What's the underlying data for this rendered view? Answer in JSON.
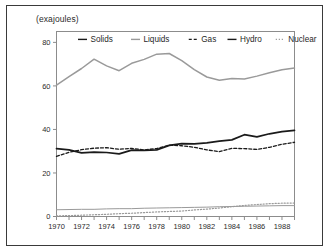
{
  "figure": {
    "axis_unit_label": "(exajoules)",
    "frame_color": "#3a3a3a",
    "background": "#ffffff"
  },
  "chart_data": {
    "type": "line",
    "title": "",
    "subtitle": "",
    "xlabel": "",
    "ylabel": "(exajoules)",
    "xlim": [
      1970,
      1989
    ],
    "ylim": [
      0,
      85
    ],
    "yticks": [
      0,
      20,
      40,
      60,
      80
    ],
    "ytick_labels": [
      "0",
      "20",
      "40",
      "60",
      "80"
    ],
    "xticks": [
      1970,
      1971,
      1972,
      1973,
      1974,
      1975,
      1976,
      1977,
      1978,
      1979,
      1980,
      1981,
      1982,
      1983,
      1984,
      1985,
      1986,
      1987,
      1988,
      1989
    ],
    "xtick_labels_shown": [
      "1970",
      "1972",
      "1974",
      "1976",
      "1978",
      "1980",
      "1982",
      "1984",
      "1986",
      "1988"
    ],
    "grid": false,
    "legend_position": "top-inside",
    "x": [
      1970,
      1971,
      1972,
      1973,
      1974,
      1975,
      1976,
      1977,
      1978,
      1979,
      1980,
      1981,
      1982,
      1983,
      1984,
      1985,
      1986,
      1987,
      1988,
      1989
    ],
    "series": [
      {
        "name": "Solids",
        "color": "#1a1a1a",
        "style": "solid",
        "width": 1.7,
        "values": [
          31.2,
          30.6,
          29.2,
          29.6,
          29.4,
          28.8,
          30.5,
          30.4,
          30.6,
          32.7,
          33.5,
          33.4,
          33.8,
          34.6,
          35.2,
          37.6,
          36.6,
          38.0,
          39.0,
          39.6
        ]
      },
      {
        "name": "Liquids",
        "color": "#9a9a9a",
        "style": "solid",
        "width": 1.5,
        "values": [
          60.4,
          64.3,
          68.0,
          72.3,
          69.2,
          67.0,
          70.4,
          72.2,
          74.6,
          74.9,
          71.6,
          67.5,
          64.1,
          62.6,
          63.4,
          63.2,
          64.5,
          66.0,
          67.4,
          68.2
        ]
      },
      {
        "name": "Gas",
        "color": "#1a1a1a",
        "style": "dashed",
        "width": 1.3,
        "values": [
          27.6,
          29.5,
          30.7,
          31.4,
          31.6,
          30.9,
          31.3,
          30.6,
          31.2,
          32.8,
          32.5,
          31.8,
          30.6,
          29.8,
          31.3,
          31.2,
          30.8,
          31.8,
          33.2,
          34.1
        ]
      },
      {
        "name": "Hydro",
        "color": "#9a9a9a",
        "style": "solid",
        "width": 1.0,
        "values": [
          3.1,
          3.2,
          3.3,
          3.3,
          3.5,
          3.6,
          3.6,
          3.8,
          3.9,
          4.0,
          4.1,
          4.2,
          4.3,
          4.5,
          4.6,
          4.7,
          4.8,
          4.9,
          5.0,
          5.0
        ]
      },
      {
        "name": "Nuclear",
        "color": "#9a9a9a",
        "style": "dotted",
        "width": 1.2,
        "values": [
          0.3,
          0.4,
          0.6,
          0.8,
          1.0,
          1.3,
          1.5,
          1.8,
          2.1,
          2.3,
          2.5,
          3.0,
          3.4,
          3.9,
          4.5,
          5.1,
          5.5,
          5.9,
          6.1,
          6.2
        ]
      }
    ],
    "legend": [
      {
        "label": "Solids",
        "color": "#1a1a1a",
        "style": "solid"
      },
      {
        "label": "Liquids",
        "color": "#9a9a9a",
        "style": "solid"
      },
      {
        "label": "Gas",
        "color": "#1a1a1a",
        "style": "dashed"
      },
      {
        "label": "Hydro",
        "color": "#1a1a1a",
        "style": "solid"
      },
      {
        "label": "Nuclear",
        "color": "#9a9a9a",
        "style": "dotted"
      }
    ]
  }
}
